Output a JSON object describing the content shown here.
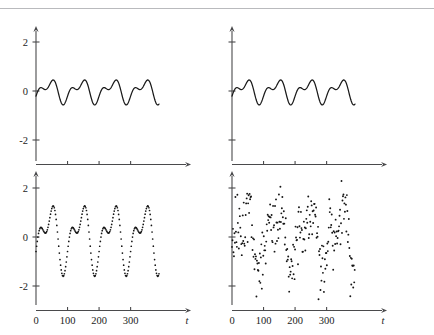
{
  "figure": {
    "title": "",
    "layout": "2x2 grid of time series panels",
    "panels": [
      {
        "id": "top-left",
        "position": "top-left",
        "render": "line",
        "x_axis": {
          "label": "t",
          "ticks": [
            0,
            100,
            200,
            300
          ],
          "tick_labels_shown": false,
          "range": [
            0,
            390
          ]
        },
        "y_axis": {
          "label": "",
          "ticks": [
            -2,
            0,
            2
          ],
          "tick_labels": [
            "-2",
            "0",
            "2"
          ],
          "tick_labels_shown": true,
          "range": [
            -3,
            3
          ]
        },
        "amplitude": 0.8
      },
      {
        "id": "top-right",
        "position": "top-right",
        "render": "line",
        "x_axis": {
          "label": "t",
          "ticks": [
            0,
            100,
            200,
            300
          ],
          "tick_labels_shown": false,
          "range": [
            0,
            390
          ]
        },
        "y_axis": {
          "label": "",
          "ticks": [
            -2,
            0,
            2
          ],
          "tick_labels": [],
          "tick_labels_shown": false,
          "range": [
            -3,
            3
          ]
        },
        "amplitude": 0.8
      },
      {
        "id": "bottom-left",
        "position": "bottom-left",
        "render": "dotted-line",
        "x_axis": {
          "label": "t",
          "ticks": [
            0,
            100,
            200,
            300
          ],
          "tick_labels": [
            "0",
            "100",
            "200",
            "300"
          ],
          "tick_labels_shown": true,
          "range": [
            0,
            390
          ]
        },
        "y_axis": {
          "label": "",
          "ticks": [
            -2,
            0,
            2
          ],
          "tick_labels": [
            "-2",
            "0",
            "2"
          ],
          "tick_labels_shown": true,
          "range": [
            -3,
            3
          ]
        },
        "amplitude": 1.8
      },
      {
        "id": "bottom-right",
        "position": "bottom-right",
        "render": "scatter",
        "x_axis": {
          "label": "t",
          "ticks": [
            0,
            100,
            200,
            300
          ],
          "tick_labels": [
            "0",
            "100",
            "200",
            "300"
          ],
          "tick_labels_shown": true,
          "range": [
            0,
            390
          ]
        },
        "y_axis": {
          "label": "",
          "ticks": [
            -2,
            0,
            2
          ],
          "tick_labels": [],
          "tick_labels_shown": false,
          "range": [
            -3,
            3
          ]
        },
        "amplitude": 1.8,
        "noise_sd": 0.62
      }
    ]
  },
  "chart_data": {
    "type": "line",
    "title": "",
    "xlabel": "t",
    "ylabel": "",
    "xlim": [
      0,
      390
    ],
    "ylim": [
      -3,
      3
    ],
    "xticks": [
      0,
      100,
      200,
      300
    ],
    "xtick_labels": [
      "0",
      "100",
      "200",
      "300"
    ],
    "yticks": [
      -2,
      0,
      2
    ],
    "ytick_labels": [
      "-2",
      "0",
      "2"
    ],
    "grid": false,
    "legend": "none",
    "period": 100,
    "waveform": {
      "description": "periodic two-harmonic signal; tall primary peak, shallow secondary hump, deep trough",
      "components": [
        {
          "harmonic": 1,
          "amplitude": 0.45,
          "phase_deg": -60
        },
        {
          "harmonic": 2,
          "amplitude": 0.3,
          "phase_deg": 25
        }
      ]
    },
    "series": [
      {
        "name": "top-left",
        "panel": "top-left",
        "style": "solid line",
        "scale": 0.8,
        "x": [
          0,
          5,
          10,
          15,
          20,
          25,
          30,
          35,
          40,
          45,
          50,
          55,
          60,
          65,
          70,
          75,
          80,
          85,
          90,
          95,
          100,
          105,
          110,
          115,
          120,
          125,
          130,
          135,
          140,
          145,
          150,
          155,
          160,
          165,
          170,
          175,
          180,
          185,
          190,
          195,
          200,
          205,
          210,
          215,
          220,
          225,
          230,
          235,
          240,
          245,
          250,
          255,
          260,
          265,
          270,
          275,
          280,
          285,
          290,
          295,
          300,
          305,
          310,
          315,
          320,
          325,
          330,
          335,
          340,
          345,
          350,
          355,
          360,
          365,
          370,
          375,
          380,
          385,
          390
        ],
        "values": [
          -0.72,
          -0.3,
          0.22,
          0.52,
          0.6,
          0.52,
          0.35,
          0.18,
          0.08,
          0.06,
          0.12,
          0.21,
          0.26,
          0.25,
          0.15,
          -0.04,
          -0.32,
          -0.6,
          -0.8,
          -0.85,
          -0.72,
          -0.3,
          0.22,
          0.52,
          0.6,
          0.52,
          0.35,
          0.18,
          0.08,
          0.06,
          0.12,
          0.21,
          0.26,
          0.25,
          0.15,
          -0.04,
          -0.32,
          -0.6,
          -0.8,
          -0.85,
          -0.72,
          -0.3,
          0.22,
          0.52,
          0.6,
          0.52,
          0.35,
          0.18,
          0.08,
          0.06,
          0.12,
          0.21,
          0.26,
          0.25,
          0.15,
          -0.04,
          -0.32,
          -0.6,
          -0.8,
          -0.85,
          -0.72,
          -0.3,
          0.22,
          0.52,
          0.6,
          0.52,
          0.35,
          0.18,
          0.08,
          0.06,
          0.12,
          0.21,
          0.26,
          0.25,
          0.15,
          -0.04,
          -0.32,
          -0.6,
          -0.8
        ]
      },
      {
        "name": "top-right",
        "panel": "top-right",
        "style": "solid line",
        "scale": 0.8,
        "x": [
          0,
          5,
          10,
          15,
          20,
          25,
          30,
          35,
          40,
          45,
          50,
          55,
          60,
          65,
          70,
          75,
          80,
          85,
          90,
          95,
          100,
          105,
          110,
          115,
          120,
          125,
          130,
          135,
          140,
          145,
          150,
          155,
          160,
          165,
          170,
          175,
          180,
          185,
          190,
          195,
          200,
          205,
          210,
          215,
          220,
          225,
          230,
          235,
          240,
          245,
          250,
          255,
          260,
          265,
          270,
          275,
          280,
          285,
          290,
          295,
          300,
          305,
          310,
          315,
          320,
          325,
          330,
          335,
          340,
          345,
          350,
          355,
          360,
          365,
          370,
          375,
          380,
          385,
          390
        ],
        "values": [
          -0.72,
          -0.3,
          0.22,
          0.52,
          0.6,
          0.52,
          0.35,
          0.18,
          0.08,
          0.06,
          0.12,
          0.21,
          0.26,
          0.25,
          0.15,
          -0.04,
          -0.32,
          -0.6,
          -0.8,
          -0.85,
          -0.72,
          -0.3,
          0.22,
          0.52,
          0.6,
          0.52,
          0.35,
          0.18,
          0.08,
          0.06,
          0.12,
          0.21,
          0.26,
          0.25,
          0.15,
          -0.04,
          -0.32,
          -0.6,
          -0.8,
          -0.85,
          -0.72,
          -0.3,
          0.22,
          0.52,
          0.6,
          0.52,
          0.35,
          0.18,
          0.08,
          0.06,
          0.12,
          0.21,
          0.26,
          0.25,
          0.15,
          -0.04,
          -0.32,
          -0.6,
          -0.8,
          -0.85,
          -0.72,
          -0.3,
          0.22,
          0.52,
          0.6,
          0.52,
          0.35,
          0.18,
          0.08,
          0.06,
          0.12,
          0.21,
          0.26,
          0.25,
          0.15,
          -0.04,
          -0.32,
          -0.6,
          -0.8
        ]
      },
      {
        "name": "bottom-left",
        "panel": "bottom-left",
        "style": "dotted line",
        "scale": 2.25,
        "x": [
          0,
          5,
          10,
          15,
          20,
          25,
          30,
          35,
          40,
          45,
          50,
          55,
          60,
          65,
          70,
          75,
          80,
          85,
          90,
          95,
          100,
          105,
          110,
          115,
          120,
          125,
          130,
          135,
          140,
          145,
          150,
          155,
          160,
          165,
          170,
          175,
          180,
          185,
          190,
          195,
          200,
          205,
          210,
          215,
          220,
          225,
          230,
          235,
          240,
          245,
          250,
          255,
          260,
          265,
          270,
          275,
          280,
          285,
          290,
          295,
          300,
          305,
          310,
          315,
          320,
          325,
          330,
          335,
          340,
          345,
          350,
          355,
          360,
          365,
          370,
          375,
          380,
          385,
          390
        ],
        "values": [
          0.62,
          1.2,
          1.7,
          1.8,
          1.62,
          1.2,
          0.65,
          0.18,
          -0.12,
          -0.22,
          -0.1,
          0.18,
          0.42,
          0.45,
          0.22,
          -0.28,
          -0.95,
          -1.55,
          -1.82,
          -1.72,
          0.62,
          1.2,
          1.7,
          1.8,
          1.62,
          1.2,
          0.65,
          0.18,
          -0.12,
          -0.22,
          -0.1,
          0.18,
          0.42,
          0.45,
          0.22,
          -0.28,
          -0.95,
          -1.55,
          -1.82,
          -1.72,
          0.62,
          1.2,
          1.7,
          1.8,
          1.62,
          1.2,
          0.65,
          0.18,
          -0.12,
          -0.22,
          -0.1,
          0.18,
          0.42,
          0.45,
          0.22,
          -0.28,
          -0.95,
          -1.55,
          -1.82,
          -1.72,
          0.62,
          1.2,
          1.7,
          1.8,
          1.62,
          1.2,
          0.65,
          0.18,
          -0.12,
          -0.22,
          -0.1,
          0.18,
          0.42,
          0.45,
          0.22,
          -0.28,
          -0.95,
          -1.55,
          -1.82
        ]
      },
      {
        "name": "bottom-right",
        "panel": "bottom-right",
        "style": "scatter",
        "scale": 2.25,
        "note": "same underlying signal as bottom-left plus additive noise"
      }
    ]
  }
}
